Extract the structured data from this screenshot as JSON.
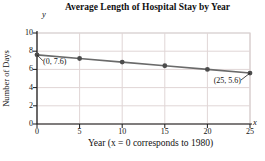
{
  "chart_data": {
    "type": "line",
    "title": "Average Length of Hospital Stay by Year",
    "xlabel": "Year (x = 0 corresponds to 1980)",
    "ylabel": "Number of Days",
    "x_axis_letter": "x",
    "y_axis_letter": "y",
    "x": [
      0,
      5,
      10,
      15,
      20,
      25
    ],
    "y": [
      7.6,
      7.2,
      6.8,
      6.4,
      6.0,
      5.6
    ],
    "xlim": [
      0,
      25
    ],
    "ylim": [
      0,
      10
    ],
    "xticks": [
      0,
      5,
      10,
      15,
      20,
      25
    ],
    "yticks": [
      0,
      2,
      4,
      6,
      8,
      10
    ],
    "grid": true,
    "legend": null,
    "annotations": [
      {
        "text": "(0, 7.6)",
        "x": 0,
        "y": 7.6,
        "align": "start",
        "dx": 6,
        "dy": 2
      },
      {
        "text": "(25, 5.6)",
        "x": 25,
        "y": 5.6,
        "align": "end",
        "dx": -9,
        "dy": 3
      }
    ],
    "colors": {
      "line": "#6a6a6a",
      "marker": "#4c4c4c",
      "grid": "#e0d6d6",
      "frame": "#c9bfbf",
      "axis": "#1a1a1a",
      "text": "#111111",
      "background": "#ffffff"
    }
  }
}
